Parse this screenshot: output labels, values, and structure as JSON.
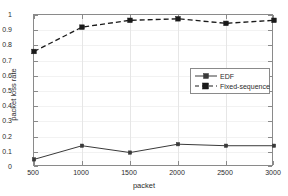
{
  "chart_data": {
    "type": "line",
    "title": "",
    "xlabel": "packet",
    "ylabel": "packet loss rate",
    "x": [
      500,
      1000,
      1500,
      2000,
      2500,
      3000
    ],
    "xlim": [
      500,
      3000
    ],
    "ylim": [
      0,
      1
    ],
    "xticks": [
      "500",
      "1000",
      "1500",
      "2000",
      "2500",
      "3000"
    ],
    "yticks": [
      "0",
      "0.1",
      "0.2",
      "0.3",
      "0.4",
      "0.5",
      "0.6",
      "0.7",
      "0.8",
      "0.9",
      "1"
    ],
    "grid": true,
    "legend_position": "center-right",
    "series": [
      {
        "name": "EDF",
        "values": [
          0.05,
          0.14,
          0.095,
          0.15,
          0.14,
          0.14
        ],
        "line_style": "solid",
        "marker": "square",
        "color": "#3a3a3a"
      },
      {
        "name": "Fixed-sequence",
        "values": [
          0.76,
          0.92,
          0.965,
          0.975,
          0.945,
          0.965
        ],
        "line_style": "dashed",
        "marker": "square",
        "color": "#1a1a1a"
      }
    ]
  },
  "legend": {
    "items": [
      {
        "label": "EDF"
      },
      {
        "label": "Fixed-sequence"
      }
    ]
  },
  "axes": {
    "x_title": "packet",
    "y_title": "packet loss rate"
  }
}
